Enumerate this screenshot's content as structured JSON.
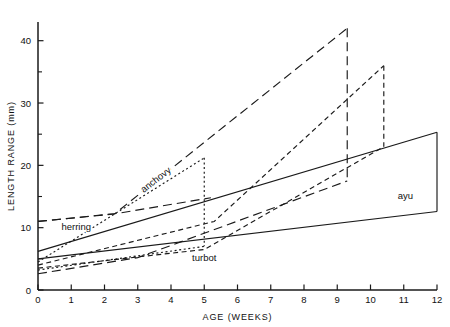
{
  "chart_data": {
    "type": "line",
    "title": "",
    "xlabel": "AGE (WEEKS)",
    "ylabel": "LENGTH RANGE (mm)",
    "xlim": [
      0,
      12
    ],
    "ylim": [
      0,
      43
    ],
    "xticks": [
      0,
      1,
      2,
      3,
      4,
      5,
      6,
      7,
      8,
      9,
      10,
      11,
      12
    ],
    "xticklabels": [
      "0",
      "1",
      "2",
      "3",
      "4",
      "5",
      "6",
      "7",
      "8",
      "9",
      "10",
      "11",
      "12"
    ],
    "yticks": [
      0,
      10,
      20,
      30,
      40
    ],
    "yticklabels": [
      "0",
      "10",
      "20",
      "30",
      "40"
    ],
    "yminorticks": [
      5,
      15,
      25,
      35
    ],
    "grid": false,
    "legend": "inline-annotations",
    "series": [
      {
        "name": "ayu",
        "label": "ayu",
        "style": "solid",
        "label_x": 11.05,
        "label_y": 14.6,
        "upper": [
          [
            0,
            6.2
          ],
          [
            12,
            25.3
          ]
        ],
        "lower": [
          [
            0,
            5.0
          ],
          [
            12,
            12.6
          ]
        ],
        "close_at_x": 12
      },
      {
        "name": "herring",
        "label": "herring",
        "style": "short-dash",
        "label_x": 1.15,
        "label_y": 9.6,
        "upper": [
          [
            0,
            4.0
          ],
          [
            5.3,
            11.0
          ],
          [
            10.4,
            36.0
          ]
        ],
        "lower": [
          [
            0,
            3.5
          ],
          [
            5.0,
            6.5
          ],
          [
            10.4,
            23.0
          ]
        ],
        "close_at_x": 10.4
      },
      {
        "name": "anchovy",
        "label": "anchovy",
        "style": "dotted",
        "label_x": 3.6,
        "label_y": 17.3,
        "label_rotate": -38,
        "upper": [
          [
            0,
            4.5
          ],
          [
            5.0,
            21.2
          ]
        ],
        "lower": [
          [
            0,
            3.2
          ],
          [
            5.0,
            7.0
          ]
        ],
        "close_at_x": 5.0
      },
      {
        "name": "turbot",
        "label": "turbot",
        "style": "long-dash",
        "label_x": 5.0,
        "label_y": 4.6,
        "upper": [
          [
            0,
            11.0
          ],
          [
            2.3,
            12.2
          ],
          [
            9.3,
            42.0
          ]
        ],
        "lower": [
          [
            0,
            2.6
          ],
          [
            3.0,
            5.2
          ],
          [
            9.3,
            17.5
          ]
        ],
        "close_at_x": 9.3
      }
    ],
    "extra_lines": [
      {
        "name": "herring-upper-band",
        "style": "long-dash",
        "points": [
          [
            0,
            11.0
          ],
          [
            2.4,
            12.3
          ],
          [
            5.2,
            14.8
          ]
        ]
      }
    ]
  },
  "figure": {
    "background": "#ffffff",
    "ink": "#1a1a1a"
  }
}
